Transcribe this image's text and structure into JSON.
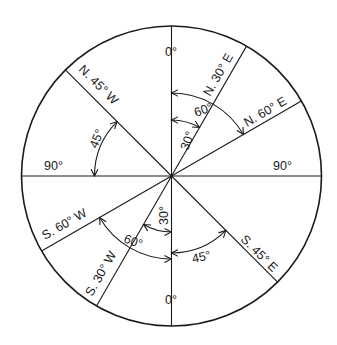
{
  "diagram": {
    "cardinal_labels": {
      "north": "0°",
      "south": "0°",
      "west": "90°",
      "east": "90°"
    },
    "bearing_labels": {
      "n30e": "N. 30° E",
      "n60e": "N. 60° E",
      "n45w": "N. 45° W",
      "s60w": "S. 60° W",
      "s30w": "S. 30° W",
      "s45e": "S. 45° E"
    },
    "angle_labels": {
      "ne_30": "30°",
      "ne_60": "60°",
      "nw_45": "45°",
      "sw_30": "30°",
      "sw_60": "60°",
      "se_45": "45°"
    },
    "bearings_deg": {
      "n30e": 30,
      "n60e": 60,
      "n45w": -45,
      "s60w": 240,
      "s30w": 210,
      "s45e": 135
    },
    "colors": {
      "line": "#1a1a1a",
      "background": "#ffffff"
    }
  }
}
